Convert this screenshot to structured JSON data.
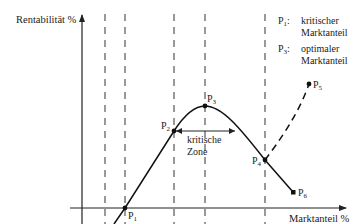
{
  "title": "",
  "axes": {
    "y_label": "Rentabilität %",
    "x_label": "Marktanteil %"
  },
  "points": [
    {
      "id": "P1",
      "base": "P",
      "sub": "1"
    },
    {
      "id": "P2",
      "base": "P",
      "sub": "2"
    },
    {
      "id": "P3",
      "base": "P",
      "sub": "3"
    },
    {
      "id": "P4",
      "base": "P",
      "sub": "4"
    },
    {
      "id": "P5",
      "base": "P",
      "sub": "5"
    },
    {
      "id": "P6",
      "base": "P",
      "sub": "6"
    }
  ],
  "legend": [
    {
      "base": "P",
      "sub": "1",
      "sep": ":",
      "line1": "kritischer",
      "line2": "Marktanteil"
    },
    {
      "base": "P",
      "sub": "3",
      "sep": ":",
      "line1": "optimaler",
      "line2": "Marktanteil"
    }
  ],
  "zone_label": {
    "line1": "kritische",
    "line2": "Zone"
  },
  "colors": {
    "ink": "#222222",
    "background": "#ffffff"
  }
}
